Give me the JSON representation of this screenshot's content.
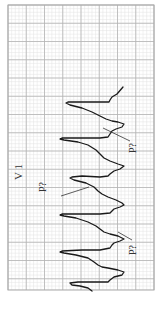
{
  "figure": {
    "lead_label": "V 1",
    "annotations": [
      {
        "text": "P?",
        "x": 136,
        "y": 148,
        "line": [
          [
            103,
            128
          ],
          [
            130,
            141
          ]
        ]
      },
      {
        "text": "P?",
        "x": 46,
        "y": 187,
        "line": [
          [
            61,
            196
          ],
          [
            89,
            187
          ]
        ]
      },
      {
        "text": "P?",
        "x": 136,
        "y": 250,
        "line": [
          [
            118,
            232
          ],
          [
            132,
            240
          ]
        ]
      }
    ],
    "colors": {
      "background": "#ffffff",
      "grid_minor": "#e3e3e3",
      "grid_major": "#b4b4b4",
      "trace": "#1a1a1a",
      "border": "#aaaaaa"
    },
    "grid": {
      "x0": 8,
      "y0": 5,
      "x1": 154,
      "y1": 290,
      "major": 18.25,
      "minor": 3.65
    }
  }
}
